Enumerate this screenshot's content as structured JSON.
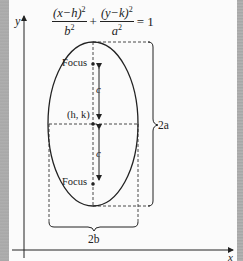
{
  "equation": {
    "term1_numerator": "(x−h)",
    "term1_numerator_exp": "2",
    "term1_denominator": "b",
    "term1_denominator_exp": "2",
    "plus": "+",
    "term2_numerator": "(y−k)",
    "term2_numerator_exp": "2",
    "term2_denominator": "a",
    "term2_denominator_exp": "2",
    "equals": "= 1"
  },
  "labels": {
    "y_axis": "y",
    "x_axis": "x",
    "focus_top": "Focus",
    "focus_bottom": "Focus",
    "center": "(h, k)",
    "c_top": "c",
    "c_bottom": "c",
    "major_axis": "2a",
    "minor_axis": "2b"
  },
  "geometry": {
    "center": [
      93,
      124
    ],
    "semi_major_a": 82,
    "semi_minor_b": 45,
    "focal_distance_c": 59,
    "orientation": "vertical"
  },
  "colors": {
    "ink": "#222222",
    "paper": "#fbfbfb",
    "edge": "#a9a9a9"
  }
}
